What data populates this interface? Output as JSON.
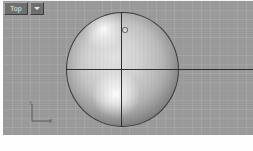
{
  "viewport": {
    "label": "Top",
    "dropdown_icon": "chevron-down-icon",
    "background_color": "#9a9a9a",
    "grid_visible": true,
    "shading_mode": "smooth-shaded"
  },
  "object": {
    "name": "Sphere",
    "type": "sphere",
    "outline_color": "#3a3a3a",
    "fill_color": "#d2d2d2",
    "highlight_color": "#ffffff"
  },
  "construction_lines": {
    "horizontal_axis_color": "#2e2e2e",
    "vertical_axis_color": "#2e2e2e"
  },
  "axis_tripod": {
    "y_label": "Y",
    "x_label": "X",
    "color": "#5a5a5a"
  }
}
